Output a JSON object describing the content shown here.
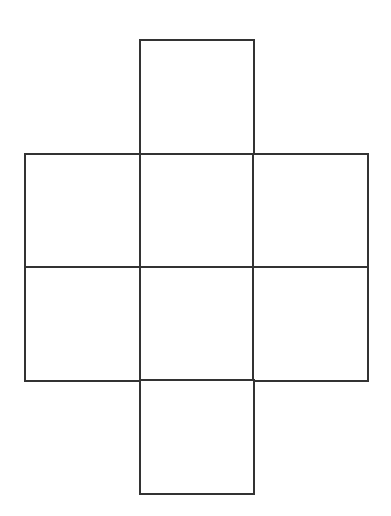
{
  "diagram": {
    "type": "cube-net",
    "stroke_color": "#333333",
    "background": "#ffffff",
    "cells": [
      {
        "id": "top",
        "x": 139,
        "y": 39,
        "w": 116,
        "h": 117
      },
      {
        "id": "mid-row1-left",
        "x": 24,
        "y": 153,
        "w": 118,
        "h": 116
      },
      {
        "id": "mid-row1-center",
        "x": 139,
        "y": 153,
        "w": 116,
        "h": 116
      },
      {
        "id": "mid-row1-right",
        "x": 252,
        "y": 153,
        "w": 117,
        "h": 116
      },
      {
        "id": "mid-row2-left",
        "x": 24,
        "y": 266,
        "w": 118,
        "h": 116
      },
      {
        "id": "mid-row2-center",
        "x": 139,
        "y": 266,
        "w": 116,
        "h": 116
      },
      {
        "id": "mid-row2-right",
        "x": 252,
        "y": 266,
        "w": 117,
        "h": 116
      },
      {
        "id": "bottom",
        "x": 139,
        "y": 379,
        "w": 116,
        "h": 116
      }
    ]
  }
}
